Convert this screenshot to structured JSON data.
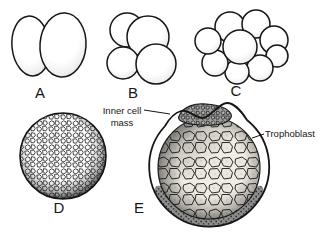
{
  "figure": {
    "background": "#ffffff",
    "ink": "#161616",
    "stages": [
      {
        "label": "A",
        "drawing": "two-cell-embryo"
      },
      {
        "label": "B",
        "drawing": "four-cell-embryo"
      },
      {
        "label": "C",
        "drawing": "eight-cell-morula"
      },
      {
        "label": "D",
        "drawing": "morula-ball"
      },
      {
        "label": "E",
        "drawing": "blastocyst-section"
      }
    ],
    "annotations": {
      "inner_cell_mass": {
        "line1": "Inner cell",
        "line2": "mass"
      },
      "trophoblast": {
        "label": "Trophoblast"
      }
    }
  }
}
